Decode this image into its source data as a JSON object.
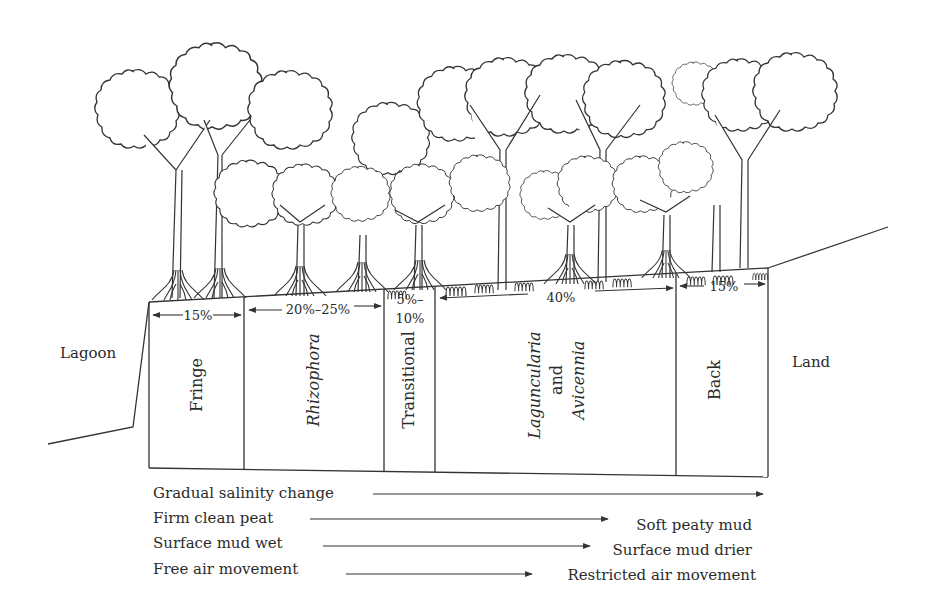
{
  "diagram": {
    "type": "mangrove zonation cross-section",
    "side_labels": {
      "left": "Lagoon",
      "right": "Land"
    },
    "zones": [
      {
        "id": "fringe",
        "label": "Fringe",
        "italic": false,
        "width_pct": "15%"
      },
      {
        "id": "rhizophora",
        "label": "Rhizophora",
        "italic": true,
        "width_pct": "20%–25%"
      },
      {
        "id": "transitional",
        "label": "Transitional",
        "italic": false,
        "width_pct_line1": "5%–",
        "width_pct_line2": "10%"
      },
      {
        "id": "laguncularia-avicennia",
        "label_line1": "Laguncularia",
        "label_line2": "and",
        "label_line3": "Avicennia",
        "italic": true,
        "width_pct": "40%"
      },
      {
        "id": "back",
        "label": "Back",
        "italic": false,
        "width_pct": "15%"
      }
    ],
    "gradients": [
      {
        "from": "Gradual salinity change",
        "to": ""
      },
      {
        "from": "Firm clean peat",
        "to": "Soft peaty mud"
      },
      {
        "from": "Surface mud wet",
        "to": "Surface mud drier"
      },
      {
        "from": "Free air movement",
        "to": "Restricted air movement"
      }
    ],
    "colors": {
      "line": "#333333",
      "text": "#2b2b2b",
      "background": "#ffffff"
    }
  }
}
